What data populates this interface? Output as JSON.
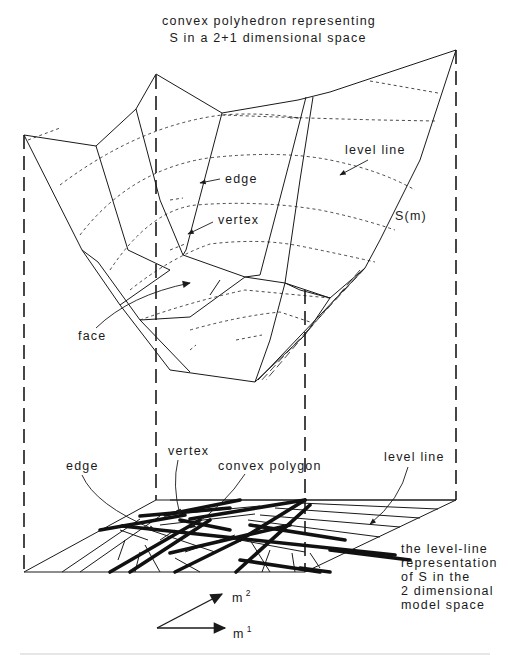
{
  "figure": {
    "title_lines": [
      "convex polyhedron representing",
      "S in a 2+1 dimensional space"
    ],
    "upper_labels": {
      "edge": "edge",
      "vertex": "vertex",
      "level_line": "level line",
      "s_of_m": "S(m)",
      "face": "face"
    },
    "lower_labels": {
      "edge": "edge",
      "vertex": "vertex",
      "convex_polygon": "convex polygon",
      "level_line": "level line"
    },
    "caption_lines": [
      "the level-line",
      "representation",
      "of S in the",
      "2 dimensional",
      "model space"
    ],
    "axes": {
      "m1_base": "m",
      "m1_sup": "1",
      "m2_base": "m",
      "m2_sup": "2"
    },
    "colors": {
      "ink": "#1a1a1a",
      "background": "#ffffff"
    }
  }
}
